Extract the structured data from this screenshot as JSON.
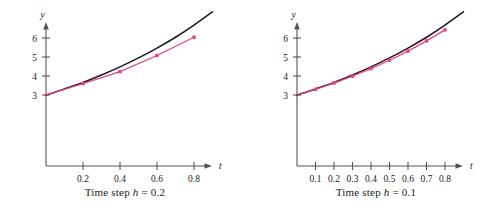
{
  "figure": {
    "background": "#ffffff"
  },
  "colors": {
    "exact_curve": "#1a1a1a",
    "euler_curve": "#e8418c",
    "euler_marker": "#e8418c",
    "axis": "#555555",
    "text": "#1a1a1a"
  },
  "panels": [
    {
      "id": "left",
      "caption_prefix": "Time step ",
      "caption_var": "h",
      "caption_suffix": " = 0.2",
      "caption_full": "Time step h = 0.2",
      "xlabel": "t",
      "ylabel": "y",
      "xticks": [
        "0.2",
        "0.4",
        "0.6",
        "0.8"
      ],
      "yticks": [
        "3",
        "4",
        "5",
        "6"
      ]
    },
    {
      "id": "right",
      "caption_prefix": "Time step ",
      "caption_var": "h",
      "caption_suffix": " = 0.1",
      "caption_full": "Time step h = 0.1",
      "xlabel": "t",
      "ylabel": "y",
      "xticks": [
        "0.1",
        "0.2",
        "0.3",
        "0.4",
        "0.5",
        "0.6",
        "0.7",
        "0.8"
      ],
      "yticks": [
        "3",
        "4",
        "5",
        "6"
      ]
    }
  ],
  "chart_data": [
    {
      "type": "line",
      "id": "time-step-0.2",
      "title": "Time step h = 0.2",
      "xlabel": "t",
      "ylabel": "y",
      "xlim": [
        0,
        0.9
      ],
      "ylim": [
        0,
        7.0
      ],
      "xticks": [
        0.2,
        0.4,
        0.6,
        0.8
      ],
      "yticks": [
        3,
        4,
        5,
        6
      ],
      "grid": false,
      "legend": "none",
      "series": [
        {
          "name": "Exact solution",
          "style": "solid-curve",
          "color": "#1a1a1a",
          "markers": false,
          "x": [
            0.0,
            0.1,
            0.2,
            0.3,
            0.4,
            0.5,
            0.6,
            0.7,
            0.8,
            0.9
          ],
          "y": [
            3.0,
            3.32,
            3.66,
            4.05,
            4.48,
            4.95,
            5.47,
            6.04,
            6.68,
            7.38
          ]
        },
        {
          "name": "Euler approximation, h = 0.2",
          "style": "polyline-with-markers",
          "color": "#e8418c",
          "markers": true,
          "x": [
            0.0,
            0.2,
            0.4,
            0.6,
            0.8
          ],
          "y": [
            3.0,
            3.6,
            4.23,
            5.08,
            6.04
          ]
        }
      ]
    },
    {
      "type": "line",
      "id": "time-step-0.1",
      "title": "Time step h = 0.1",
      "xlabel": "t",
      "ylabel": "y",
      "xlim": [
        0,
        0.9
      ],
      "ylim": [
        0,
        7.0
      ],
      "xticks": [
        0.1,
        0.2,
        0.3,
        0.4,
        0.5,
        0.6,
        0.7,
        0.8
      ],
      "yticks": [
        3,
        4,
        5,
        6
      ],
      "grid": false,
      "legend": "none",
      "series": [
        {
          "name": "Exact solution",
          "style": "solid-curve",
          "color": "#1a1a1a",
          "markers": false,
          "x": [
            0.0,
            0.1,
            0.2,
            0.3,
            0.4,
            0.5,
            0.6,
            0.7,
            0.8,
            0.9
          ],
          "y": [
            3.0,
            3.32,
            3.66,
            4.05,
            4.48,
            4.95,
            5.47,
            6.04,
            6.68,
            7.38
          ]
        },
        {
          "name": "Euler approximation, h = 0.1",
          "style": "polyline-with-markers",
          "color": "#e8418c",
          "markers": true,
          "x": [
            0.0,
            0.1,
            0.2,
            0.3,
            0.4,
            0.5,
            0.6,
            0.7,
            0.8
          ],
          "y": [
            3.0,
            3.3,
            3.63,
            3.99,
            4.39,
            4.83,
            5.31,
            5.85,
            6.43
          ]
        }
      ]
    }
  ]
}
